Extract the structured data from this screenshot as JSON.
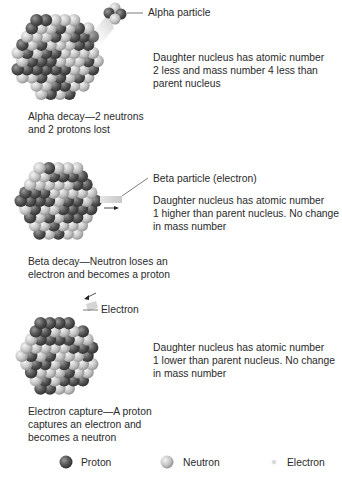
{
  "diagram": {
    "panels": [
      {
        "id": "alpha",
        "particle_label": "Alpha particle",
        "description": "Daughter nucleus has atomic number 2 less and mass number 4 less than parent nucleus",
        "desc_lines": [
          "Daughter nucleus has atomic number",
          "2 less and mass number 4 less than",
          "parent nucleus"
        ],
        "caption_lines": [
          "Alpha decay—2 neutrons",
          "and 2 protons lost"
        ]
      },
      {
        "id": "beta",
        "particle_label": "Beta particle (electron)",
        "desc_lines": [
          "Daughter nucleus has atomic number",
          "1 higher than parent nucleus. No change",
          "in mass number"
        ],
        "caption_lines": [
          "Beta decay—Neutron loses an",
          "electron and becomes a proton"
        ]
      },
      {
        "id": "electron-capture",
        "particle_label": "Electron",
        "desc_lines": [
          "Daughter nucleus has atomic number",
          "1 lower than parent nucleus. No change",
          "in mass number"
        ],
        "caption_lines": [
          "Electron capture—A proton",
          "captures an electron and",
          "becomes a neutron"
        ]
      }
    ],
    "legend": [
      {
        "label": "Proton",
        "icon": "proton-sphere-icon",
        "color": "#5a5a5a"
      },
      {
        "label": "Neutron",
        "icon": "neutron-sphere-icon",
        "color": "#c8c8c8"
      },
      {
        "label": "Electron",
        "icon": "electron-dot-icon",
        "color": "#bdbdbd"
      }
    ]
  },
  "colors": {
    "proton": "#5a5a5a",
    "neutron": "#cfcfcf",
    "text": "#2a2a2a"
  }
}
